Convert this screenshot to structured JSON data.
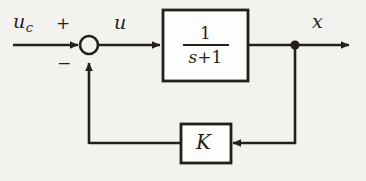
{
  "diagram": {
    "ink_color": "#241f1c",
    "background_color": "#f4f2ee",
    "signals": {
      "reference_input": "u",
      "reference_input_subscript": "c",
      "control_signal": "u",
      "output_signal": "x"
    },
    "summing_junction": {
      "positive_sign": "+",
      "negative_sign": "−"
    },
    "plant_block": {
      "numerator": "1",
      "denominator_variable": "s",
      "denominator_operator": "+",
      "denominator_constant": "1"
    },
    "feedback_block": {
      "gain_label": "K"
    }
  }
}
